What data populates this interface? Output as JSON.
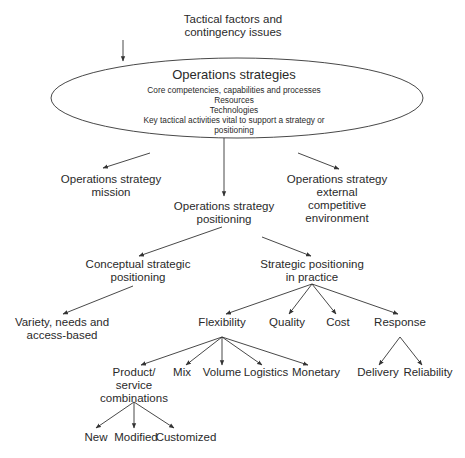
{
  "diagram": {
    "top": [
      "Tactical factors and",
      "contingency issues"
    ],
    "ellipse": {
      "title": "Operations strategies",
      "lines": [
        "Core competencies, capabilities and processes",
        "Resources",
        "Technologies",
        "Key tactical activities vital to support a strategy or",
        "positioning"
      ]
    },
    "mission": [
      "Operations strategy",
      "mission"
    ],
    "positioning": [
      "Operations strategy",
      "positioning"
    ],
    "external": [
      "Operations strategy",
      "external",
      "competitive",
      "environment"
    ],
    "conceptual": [
      "Conceptual strategic",
      "positioning"
    ],
    "practice": [
      "Strategic positioning",
      "in practice"
    ],
    "variety": [
      "Variety, needs and",
      "access-based"
    ],
    "flexibility": "Flexibility",
    "quality": "Quality",
    "cost": "Cost",
    "response": "Response",
    "product": [
      "Product/",
      "service",
      "combinations"
    ],
    "mix": "Mix",
    "volume": "Volume",
    "logistics": "Logistics",
    "monetary": "Monetary",
    "delivery": "Delivery",
    "reliability": "Reliability",
    "new": "New",
    "modified": "Modified",
    "customized": "Customized"
  }
}
